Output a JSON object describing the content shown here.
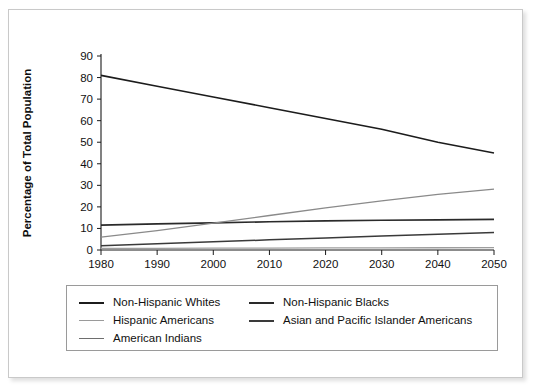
{
  "chart_data": {
    "type": "line",
    "title": "",
    "xlabel": "",
    "ylabel": "Percentage of Total Population",
    "x": [
      1980,
      1990,
      2000,
      2010,
      2020,
      2030,
      2040,
      2050
    ],
    "xlim": [
      1980,
      2050
    ],
    "ylim": [
      0,
      90
    ],
    "xticks": [
      "1980",
      "1990",
      "2000",
      "2010",
      "2020",
      "2030",
      "2040",
      "2050"
    ],
    "yticks": [
      "0",
      "10",
      "20",
      "30",
      "40",
      "50",
      "60",
      "70",
      "80",
      "90"
    ],
    "grid": false,
    "legend_position": "below-plot",
    "series": [
      {
        "name": "Non-Hispanic Whites",
        "color": "#1c1c1c",
        "width": 1.6,
        "values": [
          81,
          76,
          71,
          66,
          61,
          56,
          50,
          45
        ]
      },
      {
        "name": "Non-Hispanic  Blacks",
        "color": "#2a2a2a",
        "width": 1.7,
        "values": [
          11.5,
          12.1,
          12.6,
          13.1,
          13.5,
          13.8,
          14.0,
          14.2
        ]
      },
      {
        "name": "Hispanic Americans",
        "color": "#8a8a8a",
        "width": 1.3,
        "values": [
          6.0,
          9.0,
          12.5,
          16.0,
          19.5,
          22.8,
          25.8,
          28.2
        ]
      },
      {
        "name": "Asian and Pacific Islander Americans",
        "color": "#3a3a3a",
        "width": 1.5,
        "values": [
          2.0,
          2.9,
          3.8,
          4.7,
          5.6,
          6.5,
          7.3,
          8.1
        ]
      },
      {
        "name": "American Indians",
        "color": "#9e9e9e",
        "width": 1.3,
        "values": [
          0.7,
          0.8,
          0.85,
          0.9,
          0.95,
          1.0,
          1.05,
          1.1
        ]
      }
    ]
  },
  "legend": {
    "items": [
      {
        "label": "Non-Hispanic Whites",
        "color": "#1c1c1c",
        "width": 2.2
      },
      {
        "label": "Non-Hispanic  Blacks",
        "color": "#2a2a2a",
        "width": 2.2
      },
      {
        "label": "Hispanic Americans",
        "color": "#9a9a9a",
        "width": 1.5
      },
      {
        "label": "Asian and Pacific Islander Americans",
        "color": "#3a3a3a",
        "width": 2.2
      },
      {
        "label": "American Indians",
        "color": "#6e6e6e",
        "width": 1.8
      }
    ]
  }
}
